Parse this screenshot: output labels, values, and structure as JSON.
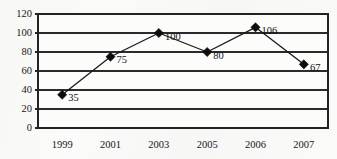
{
  "chart_data": {
    "type": "line",
    "title": "",
    "subtitle": "",
    "xlabel": "",
    "ylabel": "",
    "categories": [
      "1999",
      "2001",
      "2003",
      "2005",
      "2006",
      "2007"
    ],
    "values": [
      35,
      75,
      100,
      80,
      106,
      67
    ],
    "point_labels": [
      "35",
      "75",
      "100",
      "80",
      "106",
      "67"
    ],
    "ylim": [
      0,
      120
    ],
    "yticks": [
      0,
      20,
      40,
      60,
      80,
      100,
      120
    ],
    "ytick_labels": [
      "0",
      "20",
      "40",
      "60",
      "80",
      "100",
      "120"
    ],
    "grid": "horizontal",
    "legend": "none",
    "marker": "diamond",
    "series": [
      {
        "name": "",
        "values": [
          35,
          75,
          100,
          80,
          106,
          67
        ]
      }
    ],
    "colors": {
      "line": "#1a1a1d",
      "marker": "#0d0d0f",
      "grid": "#2b2b2e",
      "frame": "#232326",
      "text": "#17171a",
      "background": "#fbfbf9"
    }
  }
}
